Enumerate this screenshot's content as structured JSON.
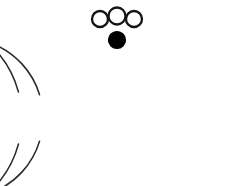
{
  "figure": {
    "title": "Two concentric open arcs with marker nodes",
    "background_color": "#ffffff",
    "width": 233,
    "height": 186,
    "stroke_color": "#2b2b2b",
    "node_outline_color": "#141414",
    "node_fill_color": "#000000",
    "node_hollow_fill": "#ffffff"
  },
  "chart_data": {
    "type": "diagram",
    "title": "Two concentric open arcs with marker nodes",
    "xlabel": "",
    "ylabel": "",
    "xlim": [
      0,
      233
    ],
    "ylim": [
      0,
      186
    ],
    "grid": false,
    "legend": "none",
    "arcs": [
      {
        "name": "outer-arc",
        "center_x": 116,
        "center_y": 118,
        "radius": 101,
        "start_angle_deg": 255,
        "end_angle_deg": 645,
        "open_at": "bottom",
        "stroke": "#2b2b2b",
        "stroke_width": 1.6,
        "apex_x": 116,
        "apex_y": 17
      },
      {
        "name": "inner-arc",
        "center_x": 116,
        "center_y": 118,
        "radius": 80,
        "start_angle_deg": 253,
        "end_angle_deg": 647,
        "open_at": "bottom",
        "stroke": "#2b2b2b",
        "stroke_width": 1.6,
        "apex_x": 116,
        "apex_y": 38
      }
    ],
    "nodes": [
      {
        "name": "outer-node-left",
        "cx": 100,
        "cy": 19,
        "r": 8,
        "style": "hollow",
        "on_arc": "outer-arc"
      },
      {
        "name": "outer-node-center",
        "cx": 117,
        "cy": 16,
        "r": 8.5,
        "style": "hollow",
        "on_arc": "outer-arc"
      },
      {
        "name": "outer-node-right",
        "cx": 134,
        "cy": 19,
        "r": 8,
        "style": "hollow",
        "on_arc": "outer-arc"
      },
      {
        "name": "inner-node-center",
        "cx": 117,
        "cy": 40,
        "r": 8.5,
        "style": "filled",
        "on_arc": "inner-arc"
      }
    ],
    "connectors": [
      {
        "name": "connector-left-center",
        "x1": 108,
        "y1": 17,
        "x2": 109,
        "y2": 17
      },
      {
        "name": "connector-center-right",
        "x1": 125,
        "y1": 17,
        "x2": 127,
        "y2": 17
      }
    ]
  }
}
